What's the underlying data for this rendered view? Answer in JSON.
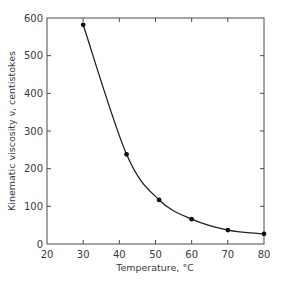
{
  "chart_data": {
    "type": "line",
    "title": "",
    "xlabel": "Temperature, °C",
    "ylabel": "Kinematic viscosity ν, centistokes",
    "xlim": [
      20,
      80
    ],
    "ylim": [
      0,
      600
    ],
    "x_ticks": [
      20,
      30,
      40,
      50,
      60,
      70,
      80
    ],
    "y_ticks": [
      0,
      100,
      200,
      300,
      400,
      500,
      600
    ],
    "grid": false,
    "legend": null,
    "series": [
      {
        "name": "Kinematic viscosity",
        "style": "smooth curve with filled circle markers",
        "x": [
          30,
          42,
          51,
          60,
          70,
          80
        ],
        "values": [
          582,
          238,
          117,
          66,
          37,
          27
        ]
      }
    ]
  },
  "colors": {
    "axis": "#4a4a4a",
    "curve": "#222222",
    "marker": "#111111",
    "text": "#3a3a3a"
  }
}
